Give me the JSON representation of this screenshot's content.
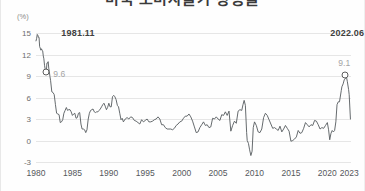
{
  "chart_data": {
    "type": "line",
    "title": "미국 소비자물가 상승률",
    "unit_label": "(%)",
    "xlabel": "",
    "ylabel": "",
    "ylim": [
      -3,
      15
    ],
    "yticks": [
      15,
      12,
      9,
      6,
      3,
      0,
      -3
    ],
    "xlim": [
      1980,
      2023.25
    ],
    "xticks": [
      1980,
      1985,
      1990,
      1995,
      2000,
      2005,
      2010,
      2015,
      2020,
      2023
    ],
    "xtick_labels": [
      "1980",
      "1985",
      "1990",
      "1995",
      "2000",
      "2005",
      "2010",
      "2015",
      "2020",
      "2023"
    ],
    "grid": true,
    "legend": "none",
    "line_color": "#555a5e",
    "series": [
      {
        "name": "US CPI inflation rate (YoY %)",
        "x": [
          1980.0,
          1980.08,
          1980.17,
          1980.25,
          1980.33,
          1980.42,
          1980.5,
          1980.58,
          1980.67,
          1980.75,
          1980.83,
          1980.92,
          1981.0,
          1981.08,
          1981.17,
          1981.25,
          1981.33,
          1981.42,
          1981.5,
          1981.58,
          1981.67,
          1981.75,
          1981.83,
          1981.92,
          1982.0,
          1982.17,
          1982.33,
          1982.5,
          1982.67,
          1982.83,
          1983.0,
          1983.17,
          1983.33,
          1983.5,
          1983.67,
          1983.83,
          1984.0,
          1984.17,
          1984.33,
          1984.5,
          1984.67,
          1984.83,
          1985.0,
          1985.17,
          1985.33,
          1985.5,
          1985.67,
          1985.83,
          1986.0,
          1986.17,
          1986.33,
          1986.5,
          1986.67,
          1986.83,
          1987.0,
          1987.17,
          1987.33,
          1987.5,
          1987.67,
          1987.83,
          1988.0,
          1988.17,
          1988.33,
          1988.5,
          1988.67,
          1988.83,
          1989.0,
          1989.17,
          1989.33,
          1989.5,
          1989.67,
          1989.83,
          1990.0,
          1990.17,
          1990.33,
          1990.5,
          1990.67,
          1990.83,
          1991.0,
          1991.17,
          1991.33,
          1991.5,
          1991.67,
          1991.83,
          1992.0,
          1992.25,
          1992.5,
          1992.75,
          1993.0,
          1993.25,
          1993.5,
          1993.75,
          1994.0,
          1994.25,
          1994.5,
          1994.75,
          1995.0,
          1995.25,
          1995.5,
          1995.75,
          1996.0,
          1996.25,
          1996.5,
          1996.75,
          1997.0,
          1997.25,
          1997.5,
          1997.75,
          1998.0,
          1998.25,
          1998.5,
          1998.75,
          1999.0,
          1999.25,
          1999.5,
          1999.75,
          2000.0,
          2000.25,
          2000.5,
          2000.75,
          2001.0,
          2001.25,
          2001.5,
          2001.75,
          2002.0,
          2002.25,
          2002.5,
          2002.75,
          2003.0,
          2003.25,
          2003.5,
          2003.75,
          2004.0,
          2004.25,
          2004.5,
          2004.75,
          2005.0,
          2005.25,
          2005.5,
          2005.75,
          2006.0,
          2006.25,
          2006.5,
          2006.75,
          2007.0,
          2007.25,
          2007.5,
          2007.75,
          2008.0,
          2008.25,
          2008.42,
          2008.58,
          2008.75,
          2008.92,
          2009.0,
          2009.17,
          2009.33,
          2009.5,
          2009.67,
          2009.83,
          2010.0,
          2010.25,
          2010.5,
          2010.75,
          2011.0,
          2011.25,
          2011.5,
          2011.75,
          2012.0,
          2012.25,
          2012.5,
          2012.75,
          2013.0,
          2013.25,
          2013.5,
          2013.75,
          2014.0,
          2014.25,
          2014.5,
          2014.75,
          2015.0,
          2015.25,
          2015.5,
          2015.75,
          2016.0,
          2016.25,
          2016.5,
          2016.75,
          2017.0,
          2017.25,
          2017.5,
          2017.75,
          2018.0,
          2018.25,
          2018.5,
          2018.75,
          2019.0,
          2019.25,
          2019.5,
          2019.75,
          2020.0,
          2020.17,
          2020.33,
          2020.5,
          2020.67,
          2020.83,
          2021.0,
          2021.17,
          2021.33,
          2021.5,
          2021.67,
          2021.92,
          2022.0,
          2022.17,
          2022.33,
          2022.46,
          2022.58,
          2022.75,
          2022.92,
          2023.0,
          2023.17
        ],
        "y": [
          13.9,
          14.2,
          14.8,
          14.7,
          14.4,
          14.4,
          13.1,
          12.9,
          12.6,
          12.8,
          12.6,
          12.5,
          11.8,
          11.4,
          10.5,
          10.0,
          9.8,
          9.6,
          10.8,
          10.8,
          11.0,
          10.1,
          9.6,
          8.9,
          8.4,
          6.8,
          6.7,
          6.4,
          5.0,
          3.8,
          3.7,
          3.6,
          2.5,
          2.6,
          2.9,
          3.8,
          4.2,
          4.6,
          4.2,
          4.3,
          4.3,
          4.0,
          3.5,
          3.7,
          3.8,
          3.1,
          3.2,
          3.8,
          3.9,
          2.3,
          1.6,
          1.6,
          1.5,
          1.1,
          1.5,
          3.0,
          3.8,
          4.2,
          4.3,
          4.4,
          4.0,
          3.9,
          4.0,
          4.0,
          4.2,
          4.4,
          4.7,
          5.0,
          5.2,
          4.8,
          4.3,
          4.6,
          5.2,
          4.7,
          4.7,
          6.1,
          6.3,
          6.1,
          5.7,
          4.9,
          4.7,
          3.8,
          2.9,
          3.1,
          2.6,
          3.0,
          3.2,
          3.0,
          3.3,
          3.2,
          2.8,
          2.7,
          2.5,
          2.3,
          2.9,
          2.6,
          2.8,
          3.0,
          2.6,
          2.6,
          2.7,
          2.9,
          3.0,
          3.3,
          3.0,
          2.2,
          2.2,
          1.8,
          1.6,
          1.6,
          1.6,
          1.5,
          1.7,
          2.1,
          2.3,
          2.6,
          2.7,
          3.1,
          3.4,
          3.4,
          3.7,
          3.3,
          2.7,
          1.9,
          1.1,
          1.2,
          1.8,
          2.2,
          2.6,
          2.1,
          2.2,
          1.8,
          1.9,
          3.1,
          3.0,
          3.3,
          3.0,
          2.8,
          3.6,
          3.5,
          4.0,
          3.5,
          4.1,
          1.3,
          2.1,
          2.7,
          2.4,
          4.1,
          4.3,
          4.2,
          5.0,
          5.6,
          4.9,
          1.1,
          0.0,
          -0.4,
          -1.3,
          -2.1,
          -1.5,
          1.8,
          2.6,
          2.1,
          1.2,
          1.1,
          1.6,
          3.2,
          3.8,
          3.5,
          2.9,
          2.3,
          1.7,
          1.8,
          1.6,
          1.4,
          2.0,
          1.2,
          1.6,
          2.1,
          1.7,
          1.3,
          -0.1,
          0.0,
          0.2,
          0.5,
          1.4,
          1.0,
          1.1,
          1.7,
          2.5,
          2.2,
          1.9,
          2.2,
          2.1,
          2.8,
          2.7,
          2.2,
          1.6,
          1.8,
          1.7,
          2.1,
          2.5,
          1.5,
          0.1,
          1.0,
          1.4,
          1.2,
          1.4,
          2.6,
          5.0,
          5.4,
          5.4,
          7.0,
          7.5,
          7.9,
          8.5,
          8.6,
          9.1,
          8.2,
          7.1,
          6.4,
          3.0
        ]
      }
    ],
    "annotations": [
      {
        "name": "peak-1981",
        "date_label": "1981.11",
        "value_label": "9.6",
        "x": 1981.42,
        "y": 9.6,
        "marker": "hollow-circle"
      },
      {
        "name": "peak-2022",
        "date_label": "2022.06",
        "value_label": "9.1",
        "x": 2022.46,
        "y": 9.1,
        "marker": "hollow-circle"
      }
    ]
  }
}
